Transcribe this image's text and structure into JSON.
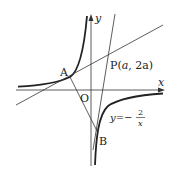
{
  "diagram": {
    "axes": {
      "x_label": "x",
      "y_label": "y",
      "origin_label": "O"
    },
    "points": {
      "A": {
        "label": "A"
      },
      "B": {
        "label": "B"
      },
      "P": {
        "label": "P",
        "coords": "(a, 2a)",
        "coords_a": "a",
        "coords_sep": ", ",
        "coords_2a": "2a"
      }
    },
    "curve": {
      "equation_lhs": "y=−",
      "num": "2",
      "den": "x"
    }
  }
}
